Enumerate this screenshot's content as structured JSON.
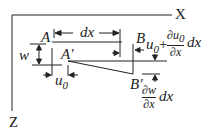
{
  "axes": {
    "x_label": "X",
    "z_label": "Z"
  },
  "points": {
    "A": "A",
    "A_prime": "A′",
    "B": "B",
    "B_prime": "B′"
  },
  "dims": {
    "dx": "dx",
    "w": "w",
    "u0": "u",
    "u0_sub": "0",
    "u0_plus": "+",
    "du0_num": "∂u",
    "du0_num_sub": "0",
    "du0_den": "∂x",
    "du0_tail": "dx",
    "dw_num": "∂w",
    "dw_den": "∂x",
    "dw_tail": "dx"
  },
  "colors": {
    "ink": "#222222",
    "background": "#ffffff"
  }
}
